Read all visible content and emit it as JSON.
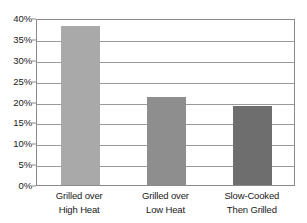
{
  "chart_data": {
    "type": "bar",
    "title": "",
    "xlabel": "",
    "ylabel": "",
    "categories": [
      "Grilled over High Heat",
      "Grilled over Low Heat",
      "Slow-Cooked Then Grilled"
    ],
    "category_lines": [
      [
        "Grilled over",
        "High Heat"
      ],
      [
        "Grilled over",
        "Low Heat"
      ],
      [
        "Slow-Cooked",
        "Then Grilled"
      ]
    ],
    "values": [
      38,
      21,
      19
    ],
    "value_labels": [
      "38%",
      "21%",
      "19%"
    ],
    "bar_colors": [
      "#a9a9a9",
      "#8e8e8e",
      "#6e6e6e"
    ],
    "ylim": [
      0,
      40
    ],
    "ytick_values": [
      40,
      35,
      30,
      25,
      20,
      15,
      10,
      5,
      0
    ],
    "ytick_labels": [
      "40%",
      "35%",
      "30%",
      "25%",
      "20%",
      "15%",
      "10%",
      "5%",
      "0%"
    ],
    "grid": true,
    "grid_axis": "y",
    "legend": false,
    "legend_position": "none",
    "frame_color": "#8a8a8a",
    "gridline_color": "#9a9a9a",
    "background": "#ffffff"
  }
}
